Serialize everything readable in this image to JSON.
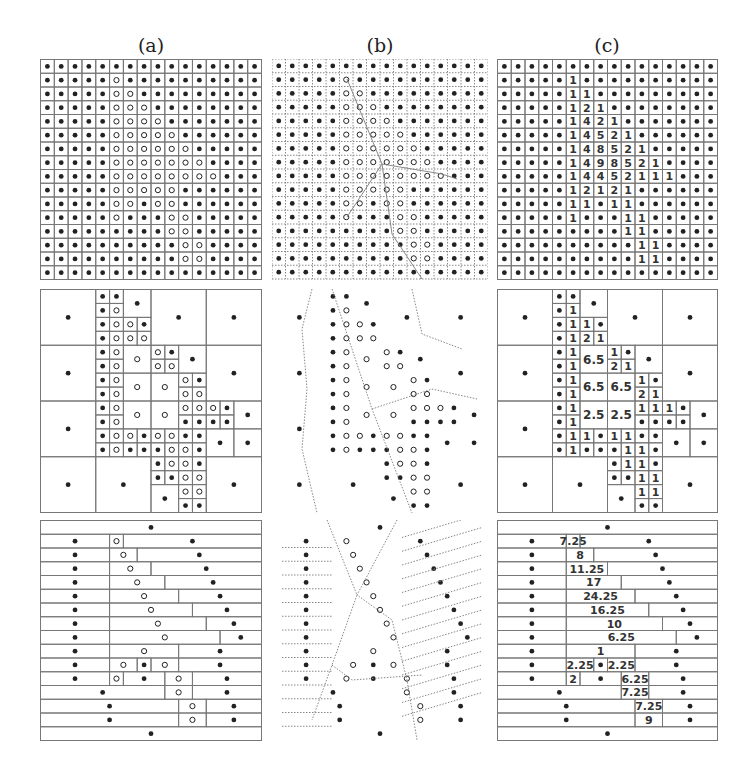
{
  "figure": {
    "column_labels": [
      "(a)",
      "(b)",
      "(c)"
    ],
    "grid_size": 16,
    "colors": {
      "line": "#777777",
      "dot": "#222222",
      "dotted": "#888888",
      "text": "#333333"
    },
    "top_values": [
      [
        0,
        0,
        0,
        0,
        0,
        0,
        0,
        0,
        0,
        0,
        0,
        0,
        0,
        0,
        0,
        0
      ],
      [
        0,
        0,
        0,
        0,
        0,
        1,
        0,
        0,
        0,
        0,
        0,
        0,
        0,
        0,
        0,
        0
      ],
      [
        0,
        0,
        0,
        0,
        0,
        1,
        1,
        0,
        0,
        0,
        0,
        0,
        0,
        0,
        0,
        0
      ],
      [
        0,
        0,
        0,
        0,
        0,
        1,
        2,
        1,
        0,
        0,
        0,
        0,
        0,
        0,
        0,
        0
      ],
      [
        0,
        0,
        0,
        0,
        0,
        1,
        4,
        2,
        1,
        0,
        0,
        0,
        0,
        0,
        0,
        0
      ],
      [
        0,
        0,
        0,
        0,
        0,
        1,
        4,
        5,
        2,
        1,
        0,
        0,
        0,
        0,
        0,
        0
      ],
      [
        0,
        0,
        0,
        0,
        0,
        1,
        4,
        8,
        5,
        2,
        1,
        0,
        0,
        0,
        0,
        0
      ],
      [
        0,
        0,
        0,
        0,
        0,
        1,
        4,
        9,
        8,
        5,
        2,
        1,
        0,
        0,
        0,
        0
      ],
      [
        0,
        0,
        0,
        0,
        0,
        1,
        4,
        4,
        5,
        2,
        1,
        1,
        1,
        0,
        0,
        0
      ],
      [
        0,
        0,
        0,
        0,
        0,
        1,
        2,
        1,
        2,
        1,
        0,
        0,
        0,
        0,
        0,
        0
      ],
      [
        0,
        0,
        0,
        0,
        0,
        1,
        1,
        0,
        1,
        1,
        0,
        0,
        0,
        0,
        0,
        0
      ],
      [
        0,
        0,
        0,
        0,
        0,
        1,
        0,
        0,
        0,
        1,
        1,
        0,
        0,
        0,
        0,
        0
      ],
      [
        0,
        0,
        0,
        0,
        0,
        0,
        0,
        0,
        0,
        1,
        1,
        0,
        0,
        0,
        0,
        0
      ],
      [
        0,
        0,
        0,
        0,
        0,
        0,
        0,
        0,
        0,
        0,
        1,
        1,
        0,
        0,
        0,
        0
      ],
      [
        0,
        0,
        0,
        0,
        0,
        0,
        0,
        0,
        0,
        0,
        1,
        1,
        0,
        0,
        0,
        0
      ],
      [
        0,
        0,
        0,
        0,
        0,
        0,
        0,
        0,
        0,
        0,
        0,
        0,
        0,
        0,
        0,
        0
      ]
    ],
    "quadtree_cells": [
      [
        0,
        0,
        4,
        4,
        ""
      ],
      [
        8,
        0,
        4,
        4,
        ""
      ],
      [
        12,
        0,
        4,
        4,
        ""
      ],
      [
        0,
        4,
        4,
        4,
        ""
      ],
      [
        12,
        4,
        4,
        4,
        ""
      ],
      [
        0,
        8,
        4,
        4,
        ""
      ],
      [
        0,
        12,
        4,
        4,
        ""
      ],
      [
        4,
        12,
        4,
        4,
        ""
      ],
      [
        12,
        12,
        4,
        4,
        ""
      ],
      [
        4,
        0,
        1,
        1,
        ""
      ],
      [
        5,
        0,
        1,
        1,
        ""
      ],
      [
        4,
        1,
        1,
        1,
        ""
      ],
      [
        5,
        1,
        1,
        1,
        "1"
      ],
      [
        6,
        0,
        2,
        2,
        ""
      ],
      [
        4,
        2,
        1,
        1,
        ""
      ],
      [
        5,
        2,
        1,
        1,
        "1"
      ],
      [
        6,
        2,
        1,
        1,
        "1"
      ],
      [
        7,
        2,
        1,
        1,
        ""
      ],
      [
        4,
        3,
        1,
        1,
        ""
      ],
      [
        5,
        3,
        1,
        1,
        "1"
      ],
      [
        6,
        3,
        1,
        1,
        "2"
      ],
      [
        7,
        3,
        1,
        1,
        "1"
      ],
      [
        4,
        4,
        1,
        1,
        ""
      ],
      [
        5,
        4,
        1,
        1,
        "1"
      ],
      [
        4,
        5,
        1,
        1,
        ""
      ],
      [
        5,
        5,
        1,
        1,
        "1"
      ],
      [
        6,
        4,
        2,
        2,
        "6.5"
      ],
      [
        8,
        4,
        1,
        1,
        "1"
      ],
      [
        9,
        4,
        1,
        1,
        ""
      ],
      [
        8,
        5,
        1,
        1,
        "2"
      ],
      [
        9,
        5,
        1,
        1,
        "1"
      ],
      [
        10,
        4,
        2,
        2,
        ""
      ],
      [
        4,
        6,
        1,
        1,
        ""
      ],
      [
        5,
        6,
        1,
        1,
        "1"
      ],
      [
        4,
        7,
        1,
        1,
        ""
      ],
      [
        5,
        7,
        1,
        1,
        "1"
      ],
      [
        6,
        6,
        2,
        2,
        "6.5"
      ],
      [
        8,
        6,
        2,
        2,
        "6.5"
      ],
      [
        10,
        6,
        1,
        1,
        "1"
      ],
      [
        11,
        6,
        1,
        1,
        ""
      ],
      [
        10,
        7,
        1,
        1,
        "2"
      ],
      [
        11,
        7,
        1,
        1,
        "1"
      ],
      [
        4,
        8,
        1,
        1,
        ""
      ],
      [
        5,
        8,
        1,
        1,
        "1"
      ],
      [
        4,
        9,
        1,
        1,
        ""
      ],
      [
        5,
        9,
        1,
        1,
        "1"
      ],
      [
        6,
        8,
        2,
        2,
        "2.5"
      ],
      [
        8,
        8,
        2,
        2,
        "2.5"
      ],
      [
        10,
        8,
        1,
        1,
        "1"
      ],
      [
        11,
        8,
        1,
        1,
        "1"
      ],
      [
        12,
        8,
        1,
        1,
        "1"
      ],
      [
        13,
        8,
        1,
        1,
        ""
      ],
      [
        10,
        9,
        1,
        1,
        ""
      ],
      [
        11,
        9,
        1,
        1,
        ""
      ],
      [
        12,
        9,
        1,
        1,
        ""
      ],
      [
        13,
        9,
        1,
        1,
        ""
      ],
      [
        14,
        8,
        2,
        2,
        ""
      ],
      [
        4,
        10,
        1,
        1,
        ""
      ],
      [
        5,
        10,
        1,
        1,
        "1"
      ],
      [
        6,
        10,
        1,
        1,
        "1"
      ],
      [
        7,
        10,
        1,
        1,
        ""
      ],
      [
        8,
        10,
        1,
        1,
        "1"
      ],
      [
        9,
        10,
        1,
        1,
        "1"
      ],
      [
        10,
        10,
        1,
        1,
        ""
      ],
      [
        11,
        10,
        1,
        1,
        ""
      ],
      [
        4,
        11,
        1,
        1,
        ""
      ],
      [
        5,
        11,
        1,
        1,
        "1"
      ],
      [
        6,
        11,
        1,
        1,
        ""
      ],
      [
        7,
        11,
        1,
        1,
        ""
      ],
      [
        8,
        11,
        1,
        1,
        ""
      ],
      [
        9,
        11,
        1,
        1,
        "1"
      ],
      [
        10,
        11,
        1,
        1,
        "1"
      ],
      [
        11,
        11,
        1,
        1,
        ""
      ],
      [
        12,
        10,
        2,
        2,
        ""
      ],
      [
        14,
        10,
        2,
        2,
        ""
      ],
      [
        8,
        12,
        1,
        1,
        ""
      ],
      [
        9,
        12,
        1,
        1,
        "1"
      ],
      [
        10,
        12,
        1,
        1,
        "1"
      ],
      [
        11,
        12,
        1,
        1,
        ""
      ],
      [
        8,
        13,
        1,
        1,
        ""
      ],
      [
        9,
        13,
        1,
        1,
        ""
      ],
      [
        10,
        13,
        1,
        1,
        "1"
      ],
      [
        11,
        13,
        1,
        1,
        "1"
      ],
      [
        8,
        14,
        2,
        2,
        ""
      ],
      [
        10,
        14,
        1,
        1,
        "1"
      ],
      [
        11,
        14,
        1,
        1,
        "1"
      ],
      [
        10,
        15,
        1,
        1,
        ""
      ],
      [
        11,
        15,
        1,
        1,
        ""
      ]
    ],
    "strip_rows": [
      [
        [
          0,
          16,
          ""
        ]
      ],
      [
        [
          0,
          5,
          ""
        ],
        [
          5,
          6,
          "7.25"
        ],
        [
          6,
          16,
          ""
        ]
      ],
      [
        [
          0,
          5,
          ""
        ],
        [
          5,
          7,
          "8"
        ],
        [
          7,
          16,
          ""
        ]
      ],
      [
        [
          0,
          5,
          ""
        ],
        [
          5,
          8,
          "11.25"
        ],
        [
          8,
          16,
          ""
        ]
      ],
      [
        [
          0,
          5,
          ""
        ],
        [
          5,
          9,
          "17"
        ],
        [
          9,
          16,
          ""
        ]
      ],
      [
        [
          0,
          5,
          ""
        ],
        [
          5,
          10,
          "24.25"
        ],
        [
          10,
          16,
          ""
        ]
      ],
      [
        [
          0,
          5,
          ""
        ],
        [
          5,
          11,
          "16.25"
        ],
        [
          11,
          16,
          ""
        ]
      ],
      [
        [
          0,
          5,
          ""
        ],
        [
          5,
          12,
          "10"
        ],
        [
          12,
          16,
          ""
        ]
      ],
      [
        [
          0,
          5,
          ""
        ],
        [
          5,
          13,
          "6.25"
        ],
        [
          13,
          16,
          ""
        ]
      ],
      [
        [
          0,
          5,
          ""
        ],
        [
          5,
          10,
          "1"
        ],
        [
          10,
          16,
          ""
        ]
      ],
      [
        [
          0,
          5,
          ""
        ],
        [
          5,
          7,
          "2.25"
        ],
        [
          7,
          8,
          ""
        ],
        [
          8,
          10,
          "2.25"
        ],
        [
          10,
          16,
          ""
        ]
      ],
      [
        [
          0,
          5,
          ""
        ],
        [
          5,
          6,
          "2"
        ],
        [
          6,
          9,
          ""
        ],
        [
          9,
          11,
          "6.25"
        ],
        [
          11,
          16,
          ""
        ]
      ],
      [
        [
          0,
          9,
          ""
        ],
        [
          9,
          11,
          "7.25"
        ],
        [
          11,
          16,
          ""
        ]
      ],
      [
        [
          0,
          10,
          ""
        ],
        [
          10,
          12,
          "7.25"
        ],
        [
          12,
          16,
          ""
        ]
      ],
      [
        [
          0,
          10,
          ""
        ],
        [
          10,
          12,
          "9"
        ],
        [
          12,
          16,
          ""
        ]
      ],
      [
        [
          0,
          16,
          ""
        ]
      ]
    ]
  }
}
